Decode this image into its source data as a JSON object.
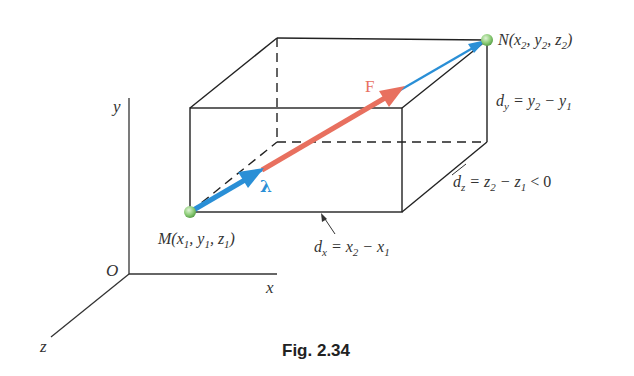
{
  "figure": {
    "caption": "Fig. 2.34",
    "axes": {
      "x_label": "x",
      "y_label": "y",
      "z_label": "z",
      "origin_label": "O"
    },
    "points": {
      "M": {
        "label_main": "M(x",
        "sub1": "1",
        "sep1": ", y",
        "sub2": "1",
        "sep2": ", z",
        "sub3": "1",
        "close": ")"
      },
      "N": {
        "label_main": "N(x",
        "sub1": "2",
        "sep1": ", y",
        "sub2": "2",
        "sep2": ", z",
        "sub3": "2",
        "close": ")"
      }
    },
    "vectors": {
      "force_label": "F",
      "unit_label": "λ",
      "force_color": "#e8705f",
      "unit_color": "#2a8fd6"
    },
    "dimensions": {
      "dx": {
        "d": "d",
        "dsub": "x",
        "eq": " = x",
        "s1": "2",
        "minus": " − x",
        "s2": "1",
        "tail": ""
      },
      "dy": {
        "d": "d",
        "dsub": "y",
        "eq": " = y",
        "s1": "2",
        "minus": " − y",
        "s2": "1",
        "tail": ""
      },
      "dz": {
        "d": "d",
        "dsub": "z",
        "eq": " = z",
        "s1": "2",
        "minus": " − z",
        "s2": "1",
        "tail": " < 0"
      }
    },
    "colors": {
      "line": "#222222",
      "point": "#8fce7a"
    }
  }
}
